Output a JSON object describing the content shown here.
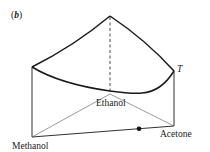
{
  "panel": {
    "open": "(",
    "letter": "b",
    "close": ")"
  },
  "axis": {
    "temperature_label": "T"
  },
  "vertices": {
    "methanol": "Methanol",
    "ethanol": "Ethanol",
    "acetone": "Acetone"
  },
  "colors": {
    "line": "#1a1a1a",
    "thin_line": "#555555",
    "background": "#ffffff"
  }
}
